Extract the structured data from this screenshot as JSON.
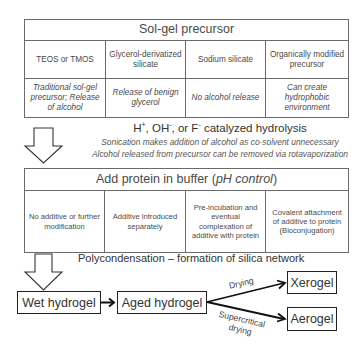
{
  "precursor_table": {
    "title": "Sol-gel precursor",
    "columns": [
      {
        "header": "TEOS or TMOS",
        "note": "Traditional sol-gel precursor; Release of alcohol"
      },
      {
        "header": "Glycerol-derivatized silicate",
        "note": "Release of benign glycerol"
      },
      {
        "header": "Sodium silicate",
        "note": "No alcohol release"
      },
      {
        "header": "Organically modified precursor",
        "note": "Can create hydrophobic environment"
      }
    ]
  },
  "hydrolysis": {
    "title_prefix": "H",
    "title_sup1": "+",
    "title_mid": ", OH",
    "title_sup2": "-",
    "title_mid2": ", or F",
    "title_sup3": "-",
    "title_suffix": " catalyzed hydrolysis",
    "note1": "Sonication makes addition of alcohol as co-solvent unnecessary",
    "note2": "Alcohol released from precursor can be removed via rotavaporization"
  },
  "protein_table": {
    "title_main": "Add protein in buffer (",
    "title_italic": "pH control",
    "title_end": ")",
    "columns": [
      "No additive or further modification",
      "Additive introduced separately",
      "Pre-incubation and eventual complexation of additive with protein",
      "Covalent attachment of additive to protein (Bioconjugation)"
    ]
  },
  "polycondensation": {
    "label": "Polycondensation – formation of silica network"
  },
  "flow": {
    "wet_hydrogel": "Wet hydrogel",
    "aged_hydrogel": "Aged hydrogel",
    "xerogel": "Xerogel",
    "aerogel": "Aerogel",
    "drying_label": "Drying",
    "supercritical_label_1": "Supercritical",
    "supercritical_label_2": "drying"
  },
  "colors": {
    "border": "#6a6a6a",
    "text": "#3a3a3a",
    "arrow": "#222222"
  }
}
